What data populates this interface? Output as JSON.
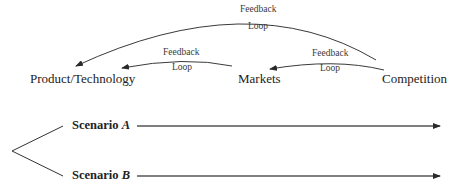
{
  "nodes": {
    "product_technology": "Product/Technology",
    "markets": "Markets",
    "competition": "Competition"
  },
  "feedback_loops": [
    {
      "label_line1": "Feedback",
      "label_line2": "Loop",
      "from": "Competition",
      "to": "Product/Technology"
    },
    {
      "label_line1": "Feedback",
      "label_line2": "Loop",
      "from": "Markets",
      "to": "Product/Technology"
    },
    {
      "label_line1": "Feedback",
      "label_line2": "Loop",
      "from": "Competition",
      "to": "Markets"
    }
  ],
  "scenarios": [
    {
      "prefix": "Scenario",
      "letter": "A"
    },
    {
      "prefix": "Scenario",
      "letter": "B"
    }
  ],
  "colors": {
    "line": "#3a3a3a",
    "text": "#222222",
    "background": "#ffffff"
  }
}
